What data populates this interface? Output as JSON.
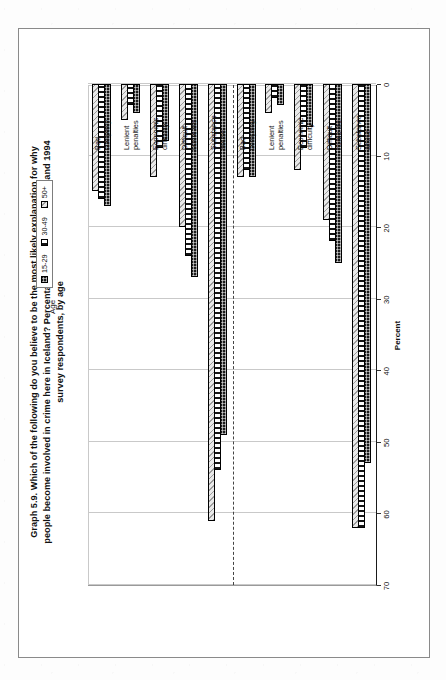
{
  "figure": {
    "title_lines": [
      "Graph 5.9.  Which of the following do you believe to be the most likely explanation for why",
      "people become involved in crime here in Iceland? Percentage distributions of 1989 and 1994",
      "survey respondents, by age"
    ],
    "year_labels": [
      {
        "text": "1989"
      },
      {
        "text": "1994"
      }
    ]
  },
  "legend": {
    "title": "Age",
    "items": [
      {
        "label": "15-29",
        "swatch": "solid-dark-dotted"
      },
      {
        "label": "30-49",
        "swatch": "vertical-stripes"
      },
      {
        "label": "50+",
        "swatch": "light-diagonal-hatch"
      }
    ]
  },
  "chart_data": {
    "type": "bar",
    "orientation": "horizontal",
    "xlabel": "Percent",
    "ylabel": "",
    "xlim": [
      0,
      70
    ],
    "xticks": [
      0,
      10,
      20,
      30,
      40,
      50,
      60,
      70
    ],
    "grid": true,
    "legend_position": "top-right",
    "legend_title": "Age",
    "groups": [
      {
        "year": "1989",
        "categories": [
          "Substance abuse",
          "Difficult home life",
          "Economic difficulty",
          "Lenient penalties",
          "Bad company"
        ],
        "series": [
          {
            "name": "15-29",
            "values": [
              53,
              25,
              6,
              3,
              13
            ]
          },
          {
            "name": "30-49",
            "values": [
              62,
              22,
              9,
              2,
              12
            ]
          },
          {
            "name": "50+",
            "values": [
              62,
              19,
              12,
              4,
              13
            ]
          }
        ]
      },
      {
        "year": "1994",
        "categories": [
          "Substance abuse",
          "Difficult home life",
          "Economic difficulty",
          "Lenient penalties",
          "Bad company"
        ],
        "series": [
          {
            "name": "15-29",
            "values": [
              49,
              27,
              8,
              4,
              17
            ]
          },
          {
            "name": "30-49",
            "values": [
              54,
              24,
              9,
              3,
              16
            ]
          },
          {
            "name": "50+",
            "values": [
              61,
              20,
              13,
              5,
              15
            ]
          }
        ]
      }
    ],
    "category_labels_order_bottom_to_top": [
      "Substance abuse",
      "Difficult home life",
      "Economic difficulty",
      "Lenient penalties",
      "Bad company",
      "Substance abuse",
      "Difficult home life",
      "Economic difficulty",
      "Lenient penalties",
      "Bad company"
    ]
  },
  "colors": {
    "ink": "#111111",
    "grid": "#c9c9c9",
    "frame": "#8a8a8a",
    "series_15_29": "#1b1b1b",
    "series_30_49": "#141414",
    "series_50_plus": "#e9e9e9"
  }
}
